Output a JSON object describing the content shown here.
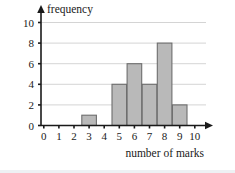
{
  "chart_data": {
    "type": "bar",
    "title": "",
    "subtitle": "",
    "xlabel": "number of marks",
    "ylabel": "frequency",
    "categories": [
      "0",
      "1",
      "2",
      "3",
      "4",
      "5",
      "6",
      "7",
      "8",
      "9",
      "10"
    ],
    "values": [
      0,
      0,
      0,
      1,
      0,
      4,
      6,
      4,
      8,
      2,
      0
    ],
    "series": [
      {
        "name": "frequency",
        "values": [
          0,
          0,
          0,
          1,
          0,
          4,
          6,
          4,
          8,
          2,
          0
        ]
      }
    ],
    "xlim": [
      0,
      10
    ],
    "ylim": [
      0,
      10
    ],
    "x_ticks": [
      "0",
      "1",
      "2",
      "3",
      "4",
      "5",
      "6",
      "7",
      "8",
      "9",
      "10"
    ],
    "y_ticks": [
      "0",
      "2",
      "4",
      "6",
      "8",
      "10"
    ],
    "y_tick_values": [
      0,
      2,
      4,
      6,
      8,
      10
    ],
    "grid": "horizontal",
    "legend": "none",
    "legend_position": "none",
    "annotations": [],
    "bar_fill_color": "#b9b9b9",
    "bar_border_color": "#6d6d6d",
    "gridline_color": "#c9c9c9",
    "axis_color": "#1a1a1a",
    "background_color": "#ffffff",
    "x_axis_has_arrow": true,
    "y_axis_has_arrow": true
  }
}
